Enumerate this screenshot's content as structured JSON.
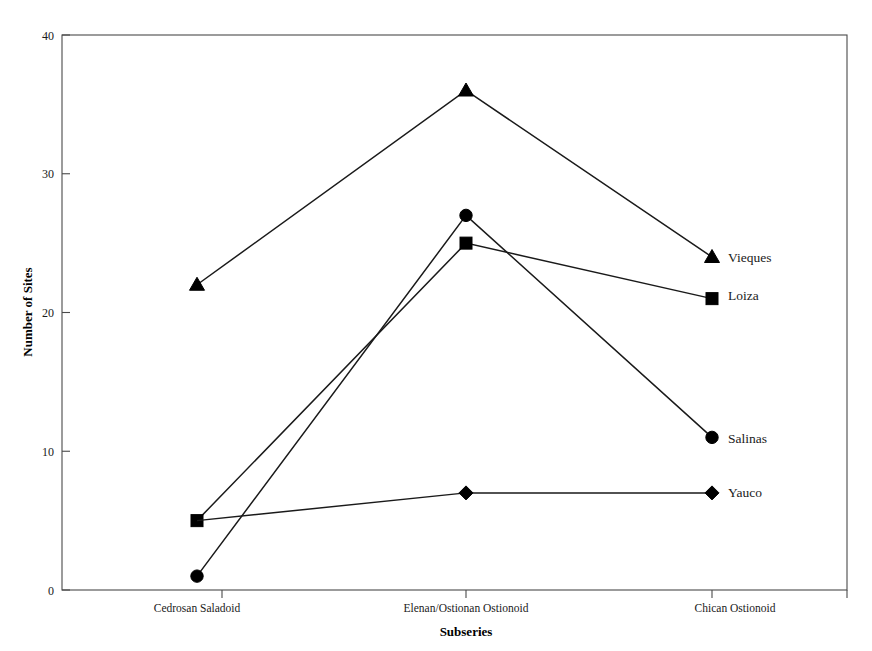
{
  "chart_data": {
    "type": "line",
    "title": "",
    "xlabel": "Subseries",
    "ylabel": "Number of Sites",
    "categories": [
      "Cedrosan Saladoid",
      "Elenan/Ostionan Ostionoid",
      "Chican Ostionoid"
    ],
    "ylim": [
      0,
      40
    ],
    "yticks": [
      0,
      10,
      20,
      30,
      40
    ],
    "ytick_labels": [
      "0",
      "10",
      "20",
      "30",
      "40"
    ],
    "grid": false,
    "legend_position": "right-inline-end-of-line",
    "series": [
      {
        "name": "Vieques",
        "marker": "triangle",
        "color": "#000000",
        "values": [
          22,
          36,
          24
        ]
      },
      {
        "name": "Loiza",
        "marker": "square",
        "color": "#000000",
        "values": [
          5,
          25,
          21
        ]
      },
      {
        "name": "Salinas",
        "marker": "circle",
        "color": "#000000",
        "values": [
          1,
          27,
          11
        ]
      },
      {
        "name": "Yauco",
        "marker": "diamond",
        "color": "#000000",
        "values": [
          5,
          7,
          7
        ]
      }
    ]
  },
  "axis": {
    "y_title": "Number of Sites",
    "x_title": "Subseries",
    "y_tick_0": "0",
    "y_tick_10": "10",
    "y_tick_20": "20",
    "y_tick_30": "30",
    "y_tick_40": "40",
    "x_cat_0": "Cedrosan Saladoid",
    "x_cat_1": "Elenan/Ostionan Ostionoid",
    "x_cat_2": "Chican Ostionoid"
  },
  "legend": {
    "vieques": "Vieques",
    "loiza": "Loiza",
    "salinas": "Salinas",
    "yauco": "Yauco"
  }
}
